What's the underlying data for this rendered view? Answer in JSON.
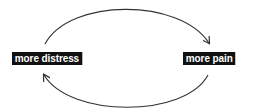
{
  "diagram": {
    "type": "cycle",
    "nodes": [
      {
        "id": "distress",
        "label": "more distress"
      },
      {
        "id": "pain",
        "label": "more pain"
      }
    ],
    "edges": [
      {
        "from": "distress",
        "to": "pain",
        "path": "top-arc"
      },
      {
        "from": "pain",
        "to": "distress",
        "path": "bottom-arc"
      }
    ],
    "colors": {
      "node_background": "#111111",
      "node_text": "#ffffff",
      "arrow": "#333333",
      "background": "#ffffff"
    }
  }
}
